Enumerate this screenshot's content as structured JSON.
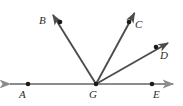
{
  "figure": {
    "type": "geometry-diagram",
    "background_color": "#ffffff",
    "ray_color": "#4d4d4d",
    "line_color": "#8c8c8c",
    "dot_color": "#1a1a1a",
    "label_color": "#2b2b2b",
    "points": [
      {
        "id": "A",
        "label": "A",
        "dot_x": 28,
        "dot_y": 84,
        "label_x": 19,
        "label_y": 89
      },
      {
        "id": "B",
        "label": "B",
        "dot_x": 60,
        "dot_y": 22,
        "label_x": 39,
        "label_y": 15
      },
      {
        "id": "C",
        "label": "C",
        "dot_x": 129,
        "dot_y": 22,
        "label_x": 135,
        "label_y": 19
      },
      {
        "id": "D",
        "label": "D",
        "dot_x": 156,
        "dot_y": 47,
        "label_x": 160,
        "label_y": 50
      },
      {
        "id": "E",
        "label": "E",
        "dot_x": 152,
        "dot_y": 84,
        "label_x": 153,
        "label_y": 89
      },
      {
        "id": "G",
        "label": "G",
        "dot_x": 96,
        "dot_y": 84,
        "label_x": 89,
        "label_y": 89
      }
    ],
    "segments": [
      {
        "name": "line-AE",
        "from": [
          6,
          84
        ],
        "to": [
          177,
          84
        ],
        "arrows": "both"
      },
      {
        "name": "ray-GB",
        "from": [
          96,
          84
        ],
        "to": [
          50,
          10
        ],
        "arrows": "end"
      },
      {
        "name": "ray-GC",
        "from": [
          96,
          84
        ],
        "to": [
          137,
          8
        ],
        "arrows": "end"
      },
      {
        "name": "ray-GD",
        "from": [
          96,
          84
        ],
        "to": [
          172,
          40
        ],
        "arrows": "end"
      }
    ]
  }
}
